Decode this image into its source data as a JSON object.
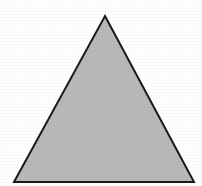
{
  "figure": {
    "background_color": "#ffffff",
    "canvas": {
      "width": 202,
      "height": 186
    }
  },
  "shape": {
    "name": "triangle",
    "kind": "polygon",
    "sides": 3,
    "fill_color": "#b9b9b9",
    "stroke_color": "#1a1a1a",
    "stroke_width": 2,
    "points_string": "105,16 194,182 14,182",
    "vertices": [
      {
        "label": "apex",
        "x": 105,
        "y": 16
      },
      {
        "label": "base-right",
        "x": 194,
        "y": 182
      },
      {
        "label": "base-left",
        "x": 14,
        "y": 182
      }
    ],
    "base_width": 180,
    "height": 166,
    "orientation": "point-up"
  },
  "chart_data": {
    "type": "polygon",
    "shapes": [
      {
        "name": "triangle",
        "type": "polygon",
        "vertices": [
          [
            105,
            16
          ],
          [
            194,
            182
          ],
          [
            14,
            182
          ]
        ],
        "fill": "#b9b9b9",
        "stroke": "#1a1a1a",
        "stroke_width": 2
      }
    ],
    "xlabel": "",
    "ylabel": "",
    "xlim": [
      0,
      202
    ],
    "ylim": [
      0,
      186
    ],
    "grid": false,
    "legend": null,
    "annotations": []
  }
}
